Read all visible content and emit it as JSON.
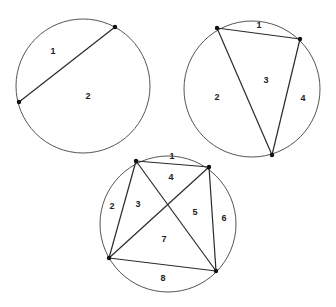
{
  "diagrams": [
    {
      "name": "circle-one-chord",
      "circle": {
        "cx": 83,
        "cy": 86,
        "r": 67
      },
      "points": [
        [
          115,
          27
        ],
        [
          19,
          102
        ]
      ],
      "chords": [
        [
          0,
          1
        ]
      ],
      "regions": [
        {
          "label": "1",
          "x": 53,
          "y": 52
        },
        {
          "label": "2",
          "x": 88,
          "y": 97
        }
      ]
    },
    {
      "name": "circle-triangle",
      "circle": {
        "cx": 252,
        "cy": 89,
        "r": 68
      },
      "points": [
        [
          217,
          28
        ],
        [
          300,
          39
        ],
        [
          272,
          155
        ]
      ],
      "chords": [
        [
          0,
          1
        ],
        [
          1,
          2
        ],
        [
          2,
          0
        ]
      ],
      "regions": [
        {
          "label": "1",
          "x": 259,
          "y": 26
        },
        {
          "label": "2",
          "x": 217,
          "y": 98
        },
        {
          "label": "3",
          "x": 266,
          "y": 81
        },
        {
          "label": "4",
          "x": 303,
          "y": 99
        }
      ]
    },
    {
      "name": "circle-quadrilateral",
      "circle": {
        "cx": 168,
        "cy": 224,
        "r": 68
      },
      "points": [
        [
          136,
          161
        ],
        [
          209,
          167
        ],
        [
          109,
          258
        ],
        [
          216,
          271
        ]
      ],
      "chords": [
        [
          0,
          1
        ],
        [
          1,
          3
        ],
        [
          3,
          2
        ],
        [
          2,
          0
        ],
        [
          0,
          3
        ],
        [
          1,
          2
        ]
      ],
      "regions": [
        {
          "label": "1",
          "x": 172,
          "y": 157
        },
        {
          "label": "4",
          "x": 171,
          "y": 178
        },
        {
          "label": "2",
          "x": 112,
          "y": 207
        },
        {
          "label": "3",
          "x": 138,
          "y": 205
        },
        {
          "label": "5",
          "x": 195,
          "y": 213
        },
        {
          "label": "6",
          "x": 224,
          "y": 219
        },
        {
          "label": "7",
          "x": 164,
          "y": 240
        },
        {
          "label": "8",
          "x": 163,
          "y": 279
        }
      ]
    }
  ]
}
